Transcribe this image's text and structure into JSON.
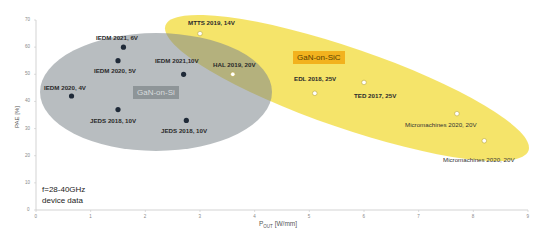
{
  "chart_data": {
    "type": "scatter",
    "title": "",
    "xlabel": "P_OUT [W/mm]",
    "xlabel_main": "P",
    "xlabel_sub": "OUT",
    "xlabel_unit": " [W/mm]",
    "ylabel": "PAE [%]",
    "xlim": [
      0,
      9
    ],
    "ylim": [
      0,
      70
    ],
    "xticks": [
      "0",
      "1",
      "2",
      "3",
      "4",
      "5",
      "6",
      "7",
      "8",
      "9"
    ],
    "yticks": [
      "0",
      "10",
      "20",
      "30",
      "40",
      "50",
      "60",
      "70"
    ],
    "grid": false,
    "annotation": {
      "line1": "f=28-40GHz",
      "line2": "device data"
    },
    "groups": [
      {
        "name": "GaN-on-Si",
        "region_color": "#8c979c",
        "marker": "filled",
        "marker_color": "#1f2a38"
      },
      {
        "name": "GaN-on-SiC",
        "region_color": "#f3df50",
        "marker": "hollow",
        "marker_color": "#ffffff"
      }
    ],
    "series": [
      {
        "name": "GaN-on-Si",
        "points": [
          {
            "label": "IEDM 2021, 6V",
            "x": 1.6,
            "y": 60
          },
          {
            "label": "IEDM 2020, 5V",
            "x": 1.5,
            "y": 55
          },
          {
            "label": "IEDM 2020, 4V",
            "x": 0.65,
            "y": 42
          },
          {
            "label": "JEDS 2018, 10V",
            "x": 1.5,
            "y": 37
          },
          {
            "label": "IEDM 2021,10V",
            "x": 2.7,
            "y": 50
          },
          {
            "label": "JEDS 2018, 10V",
            "x": 2.75,
            "y": 33
          }
        ]
      },
      {
        "name": "GaN-on-SiC",
        "points": [
          {
            "label": "MTTS 2019, 14V",
            "x": 3.0,
            "y": 65
          },
          {
            "label": "HAL 2019, 20V",
            "x": 3.6,
            "y": 50
          },
          {
            "label": "EDL 2018, 25V",
            "x": 5.1,
            "y": 43
          },
          {
            "label": "TED 2017, 25V",
            "x": 6.0,
            "y": 47
          },
          {
            "label": "Micromachines 2020, 20V",
            "x": 7.7,
            "y": 35.5
          },
          {
            "label": "Micromachines 2020, 20V",
            "x": 8.2,
            "y": 25.5
          }
        ]
      }
    ]
  }
}
